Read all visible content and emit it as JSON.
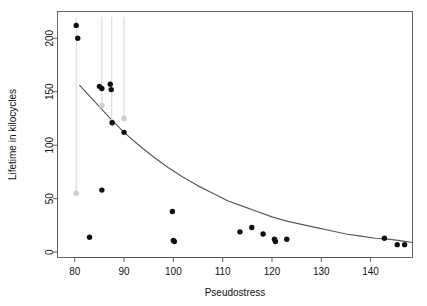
{
  "chart_data": {
    "type": "scatter",
    "title": "",
    "xlabel": "Pseudostress",
    "ylabel": "Lifetime in kilocycles",
    "xlim": [
      76.5,
      148.5
    ],
    "ylim": [
      -5,
      225
    ],
    "xticks": [
      80,
      90,
      100,
      110,
      120,
      130,
      140
    ],
    "yticks": [
      0,
      50,
      100,
      150,
      200
    ],
    "grid": false,
    "legend": null,
    "point_color": "#111111",
    "censored_point_color": "#cfcfcf",
    "censor_line_color": "#d6d6d6",
    "fit_line_color": "#595959",
    "series": [
      {
        "name": "Observed failures",
        "marker": "filled-circle",
        "color": "#111111",
        "points": [
          {
            "x": 80.3,
            "y": 212
          },
          {
            "x": 80.6,
            "y": 200
          },
          {
            "x": 85.0,
            "y": 155
          },
          {
            "x": 85.5,
            "y": 153
          },
          {
            "x": 87.2,
            "y": 157
          },
          {
            "x": 87.4,
            "y": 152
          },
          {
            "x": 87.6,
            "y": 121
          },
          {
            "x": 90.0,
            "y": 112
          },
          {
            "x": 85.5,
            "y": 58
          },
          {
            "x": 83.0,
            "y": 14
          },
          {
            "x": 99.8,
            "y": 38
          },
          {
            "x": 100.0,
            "y": 11
          },
          {
            "x": 100.2,
            "y": 10
          },
          {
            "x": 113.5,
            "y": 19
          },
          {
            "x": 115.9,
            "y": 23
          },
          {
            "x": 118.2,
            "y": 17
          },
          {
            "x": 120.5,
            "y": 12
          },
          {
            "x": 120.7,
            "y": 10
          },
          {
            "x": 123.0,
            "y": 12
          },
          {
            "x": 142.8,
            "y": 13
          },
          {
            "x": 145.4,
            "y": 7
          },
          {
            "x": 146.9,
            "y": 7
          }
        ]
      },
      {
        "name": "Right-censored (runouts)",
        "marker": "open-circle",
        "color": "#cfcfcf",
        "points": [
          {
            "x": 80.3,
            "y": 55
          },
          {
            "x": 85.5,
            "y": 137
          },
          {
            "x": 87.5,
            "y": 122
          },
          {
            "x": 90.0,
            "y": 125
          }
        ],
        "censor_bars": [
          {
            "x": 80.3,
            "y_from": 220,
            "y_to": 55
          },
          {
            "x": 85.5,
            "y_from": 220,
            "y_to": 137
          },
          {
            "x": 87.5,
            "y_from": 220,
            "y_to": 122
          },
          {
            "x": 90.0,
            "y_from": 220,
            "y_to": 125
          }
        ]
      }
    ],
    "fit_curve": {
      "name": "Fitted regression curve",
      "color": "#595959",
      "points": [
        {
          "x": 81.0,
          "y": 156
        },
        {
          "x": 84.0,
          "y": 141
        },
        {
          "x": 87.0,
          "y": 126
        },
        {
          "x": 90.0,
          "y": 112
        },
        {
          "x": 93.0,
          "y": 100
        },
        {
          "x": 96.0,
          "y": 89
        },
        {
          "x": 99.0,
          "y": 79
        },
        {
          "x": 102.0,
          "y": 70
        },
        {
          "x": 105.0,
          "y": 62
        },
        {
          "x": 108.0,
          "y": 55
        },
        {
          "x": 111.0,
          "y": 48
        },
        {
          "x": 114.0,
          "y": 43
        },
        {
          "x": 117.0,
          "y": 38
        },
        {
          "x": 120.0,
          "y": 33
        },
        {
          "x": 123.0,
          "y": 29
        },
        {
          "x": 126.0,
          "y": 26
        },
        {
          "x": 129.0,
          "y": 23
        },
        {
          "x": 132.0,
          "y": 20
        },
        {
          "x": 135.0,
          "y": 17
        },
        {
          "x": 138.0,
          "y": 15
        },
        {
          "x": 141.0,
          "y": 13
        },
        {
          "x": 144.0,
          "y": 12
        },
        {
          "x": 147.0,
          "y": 10
        },
        {
          "x": 148.5,
          "y": 9
        }
      ]
    }
  }
}
